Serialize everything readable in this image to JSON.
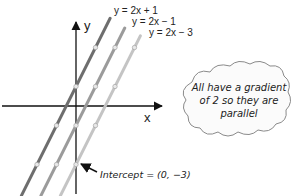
{
  "diagram": {
    "axes": {
      "x_label": "x",
      "y_label": "y"
    },
    "lines": [
      {
        "label": "y = 2x + 1",
        "gradient": 2,
        "intercept": 1,
        "color": "#6e6e6e",
        "points": [
          [
            -2,
            -3
          ],
          [
            -1,
            -1
          ],
          [
            0,
            1
          ],
          [
            1,
            3
          ]
        ]
      },
      {
        "label": "y = 2x − 1",
        "gradient": 2,
        "intercept": -1,
        "color": "#9b9b9b",
        "points": [
          [
            -1,
            -3
          ],
          [
            0,
            -1
          ],
          [
            1,
            1
          ],
          [
            2,
            3
          ]
        ]
      },
      {
        "label": "y = 2x − 3",
        "gradient": 2,
        "intercept": -3,
        "color": "#c4c4c4",
        "points": [
          [
            0,
            -3
          ],
          [
            1,
            -1
          ],
          [
            2,
            1
          ],
          [
            3,
            3
          ]
        ]
      }
    ],
    "annotation": {
      "text": "Intercept = (0, −3)"
    },
    "callout": {
      "lines": [
        "All have a gradient",
        "of 2 so they are",
        "parallel"
      ]
    }
  }
}
